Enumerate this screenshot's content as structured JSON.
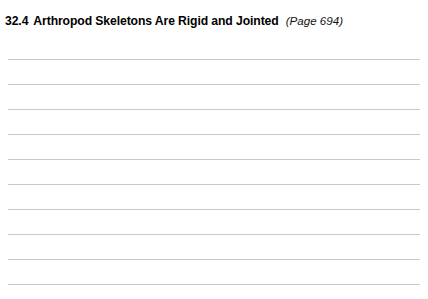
{
  "document": {
    "heading": {
      "number": "32.4",
      "title": "Arthropod Skeletons Are Rigid and Jointed",
      "page_reference": "(Page 694)"
    },
    "writing_area": {
      "line_count": 10,
      "first_line_y": 59,
      "line_spacing": 25,
      "line_left": 8,
      "line_width": 412,
      "line_color": "#c9c9c9"
    },
    "colors": {
      "background": "#ffffff",
      "heading_text": "#000000",
      "rule": "#c9c9c9"
    }
  }
}
